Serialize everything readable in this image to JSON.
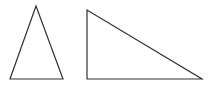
{
  "diagram": {
    "background": "#ffffff",
    "stroke_color": "#333333",
    "stroke_width": 1.2,
    "shapes": [
      {
        "name": "isosceles-triangle",
        "points": "36,6 10,79 63,79"
      },
      {
        "name": "right-triangle",
        "points": "87,10 87,79 202,79"
      }
    ]
  }
}
